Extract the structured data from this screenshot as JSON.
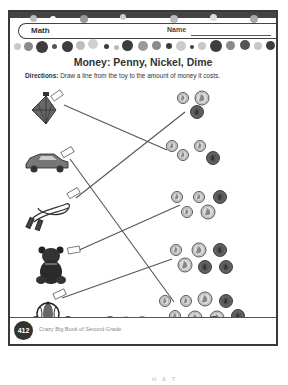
{
  "header": {
    "subject": "Math",
    "name_label": "Name"
  },
  "title": "Money: Penny, Nickel, Dime",
  "directions": {
    "label": "Directions:",
    "text": " Draw a line from the toy to the amount of money it costs."
  },
  "toys": [
    {
      "name": "spinning-top",
      "tag": "5¢"
    },
    {
      "name": "toy-car",
      "tag": "10¢"
    },
    {
      "name": "jump-rope",
      "tag": "15¢"
    },
    {
      "name": "teddy-bear",
      "tag": "20¢"
    },
    {
      "name": "beach-ball",
      "tag": "25¢"
    }
  ],
  "coin_groups": [
    {
      "coins": [
        "dime",
        "nickel",
        "penny"
      ]
    },
    {
      "coins": [
        "dime",
        "dime",
        "dime",
        "penny"
      ]
    },
    {
      "coins": [
        "dime",
        "dime",
        "penny",
        "dime",
        "nickel"
      ]
    },
    {
      "coins": [
        "dime",
        "nickel",
        "penny",
        "nickel",
        "penny",
        "penny"
      ]
    },
    {
      "coins": [
        "dime",
        "dime",
        "nickel",
        "penny",
        "dime",
        "nickel",
        "nickel",
        "penny"
      ]
    }
  ],
  "footer": {
    "page_number": "412",
    "book_title": "Crazy Big Book of Second Grade"
  },
  "below_page_text": "H & T",
  "colors": {
    "ink": "#333333",
    "border": "#3a3a3a",
    "dot_dark": "#3d3d3d",
    "dot_mid": "#8a8a8a",
    "dot_light": "#c8c8c8",
    "coin_silver": "#d9d9d9",
    "coin_copper": "#555555"
  }
}
